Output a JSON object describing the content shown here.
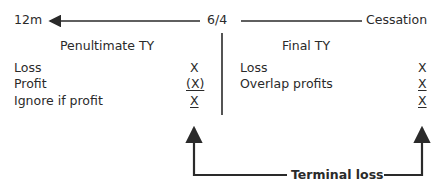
{
  "timeline": {
    "left_label": "12m",
    "center_label": "6/4",
    "right_label": "Cessation"
  },
  "left_column": {
    "title": "Penultimate TY",
    "rows": [
      {
        "label": "Loss",
        "value": "X",
        "underline": false
      },
      {
        "label": "Profit",
        "value": "(X)",
        "underline": true
      },
      {
        "label": "Ignore if profit",
        "value": "X",
        "underline": true
      }
    ]
  },
  "right_column": {
    "title": "Final TY",
    "rows": [
      {
        "label": "Loss",
        "value": "X",
        "underline": false
      },
      {
        "label": "Overlap profits",
        "value": "X",
        "underline": true
      },
      {
        "label": "",
        "value": "X",
        "underline": true
      }
    ]
  },
  "footer": {
    "label": "Terminal loss"
  },
  "colors": {
    "line": "#2a2a2a",
    "text": "#2a2a2a"
  }
}
